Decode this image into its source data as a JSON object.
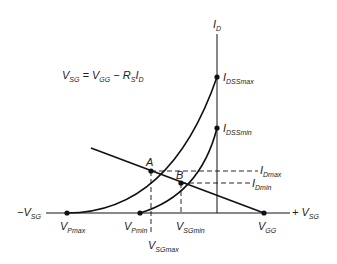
{
  "equation": {
    "v": "V",
    "sg": "SG",
    "eq": " = V",
    "gg": "GG",
    "minus": " − R",
    "s": "S",
    "i": "I",
    "d": "D"
  },
  "axes": {
    "y_label": {
      "main": "I",
      "sub": "D"
    },
    "x_neg": {
      "main": "−V",
      "sub": "SG"
    },
    "x_pos": {
      "main": "+ V",
      "sub": "SG"
    }
  },
  "points": {
    "idss_max": {
      "main": "I",
      "sub": "DSSmax"
    },
    "idss_min": {
      "main": "I",
      "sub": "DSSmin"
    },
    "A": "A",
    "B": "B",
    "id_max": {
      "main": "I",
      "sub": "Dmax"
    },
    "id_min": {
      "main": "I",
      "sub": "Dmin"
    },
    "vp_max": {
      "main": "V",
      "sub": "Pmax"
    },
    "vp_min": {
      "main": "V",
      "sub": "Pmin"
    },
    "vsg_min": {
      "main": "V",
      "sub": "SGmin"
    },
    "vsg_max": {
      "main": "V",
      "sub": "SGmax"
    },
    "vgg": {
      "main": "V",
      "sub": "GG"
    }
  },
  "colors": {
    "line": "#111111",
    "text": "#222222"
  }
}
